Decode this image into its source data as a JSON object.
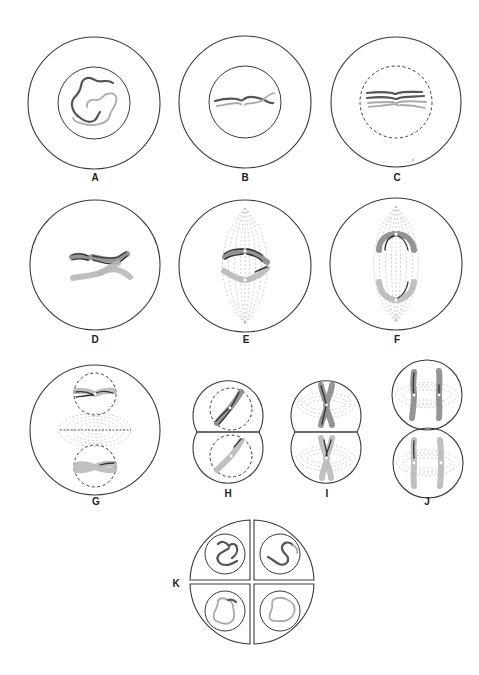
{
  "figure": {
    "type": "meiosis-stages-diagram",
    "panels": [
      {
        "id": "A",
        "label": "A",
        "description": "cell with nucleus containing long thin chromosome threads"
      },
      {
        "id": "B",
        "label": "B",
        "description": "homologous chromosomes pairing (synapsis) within nucleus"
      },
      {
        "id": "C",
        "label": "C",
        "description": "paired chromatids visible, nuclear envelope breaking (dashed)"
      },
      {
        "id": "D",
        "label": "D",
        "description": "condensed homologous pair (tetrad) with crossing over"
      },
      {
        "id": "E",
        "label": "E",
        "description": "tetrad aligned at equator with spindle fibers"
      },
      {
        "id": "F",
        "label": "F",
        "description": "homologs separating to poles along spindle"
      },
      {
        "id": "G",
        "label": "G",
        "description": "two nuclei forming with cell plate between"
      },
      {
        "id": "H",
        "label": "H",
        "description": "two daughter cells each with nucleus and one chromosome"
      },
      {
        "id": "I",
        "label": "I",
        "description": "second division metaphase in both cells with spindles"
      },
      {
        "id": "J",
        "label": "J",
        "description": "second division anaphase, chromatids separating"
      },
      {
        "id": "K",
        "label": "K",
        "description": "four daughter cells each with a single-chromosome nucleus"
      }
    ],
    "colors": {
      "outline": "#3a3a3a",
      "chromosome_dark": "#555555",
      "chromosome_light": "#aaaaaa",
      "spindle": "#bdbdbd",
      "background": "#ffffff"
    }
  }
}
